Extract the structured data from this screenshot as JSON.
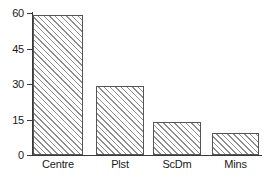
{
  "chart_data": {
    "type": "bar",
    "title": "",
    "subtitle": "",
    "xlabel": "",
    "ylabel": "",
    "categories": [
      "Centre",
      "Plst",
      "ScDm",
      "Mins"
    ],
    "values": [
      59,
      29,
      14,
      9.5
    ],
    "ylim": [
      0,
      60
    ],
    "yticks": [
      0,
      15,
      30,
      45,
      60
    ],
    "ytick_labels": [
      "0",
      "15",
      "30",
      "45",
      "60"
    ],
    "grid": false,
    "legend": null,
    "series": [
      {
        "name": "",
        "values": [
          59,
          29,
          14,
          9.5
        ]
      }
    ],
    "bar_style": {
      "fill": "diagonal-hatch",
      "hatch_color": "#8f8f8f",
      "background": "#ffffff",
      "edge_color": "#555555"
    },
    "axis_color": "#3a3a3a",
    "text_color": "#1a1a1a"
  }
}
